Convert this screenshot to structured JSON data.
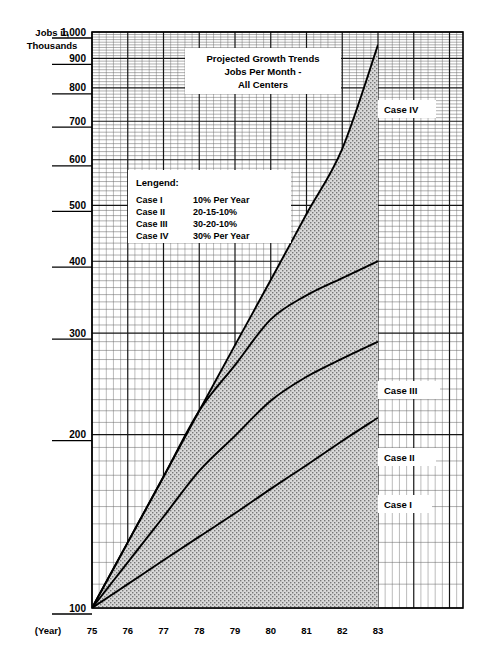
{
  "axis": {
    "y_title_line1": "Jobs in",
    "y_title_line2": "Thousands",
    "x_title": "(Year)",
    "y_ticks": [
      "1,000",
      "900",
      "800",
      "700",
      "600",
      "500",
      "400",
      "300",
      "200",
      "100"
    ],
    "x_ticks": [
      "75",
      "76",
      "77",
      "78",
      "79",
      "80",
      "81",
      "82",
      "83"
    ]
  },
  "title": {
    "line1": "Projected Growth Trends",
    "line2": "Jobs Per Month -",
    "line3": "All Centers"
  },
  "legend": {
    "heading": "Lengend:",
    "rows": [
      {
        "name": "Case I",
        "rate": "10% Per Year"
      },
      {
        "name": "Case II",
        "rate": "20-15-10%"
      },
      {
        "name": "Case III",
        "rate": "30-20-10%"
      },
      {
        "name": "Case IV",
        "rate": "30% Per Year"
      }
    ]
  },
  "curve_labels": {
    "case1": "Case I",
    "case2": "Case II",
    "case3": "Case III",
    "case4": "Case IV"
  },
  "chart_data": {
    "type": "line",
    "title": "Projected Growth Trends Jobs Per Month - All Centers",
    "xlabel": "(Year)",
    "ylabel": "Jobs in Thousands",
    "yscale": "log",
    "ylim": [
      100,
      1000
    ],
    "xlim": [
      75,
      83
    ],
    "grid": true,
    "legend_position": "upper-left-inset",
    "x": [
      75,
      76,
      77,
      78,
      79,
      80,
      81,
      82,
      83
    ],
    "series": [
      {
        "name": "Case I",
        "rate": "10% Per Year",
        "fill": "dark-dense-dots",
        "values": [
          100,
          110,
          121,
          133,
          146,
          161,
          177,
          195,
          214
        ]
      },
      {
        "name": "Case II",
        "rate": "20-15-10%",
        "fill": "white-checker",
        "values": [
          100,
          120,
          144,
          173,
          199,
          229,
          252,
          271,
          290
        ]
      },
      {
        "name": "Case III",
        "rate": "30-20-10%",
        "fill": "medium-crosshatch",
        "values": [
          100,
          130,
          169,
          220,
          264,
          317,
          349,
          374,
          400
        ]
      },
      {
        "name": "Case IV",
        "rate": "30% Per Year",
        "fill": "light-gray-stipple",
        "values": [
          100,
          130,
          169,
          220,
          286,
          371,
          483,
          627,
          950
        ]
      }
    ]
  },
  "colors": {
    "ink": "#000000",
    "grid_major": "#1a1a1a",
    "grid_minor": "#555555",
    "band_case1": "#2b2b2b",
    "band_case2": "#f2f2f2",
    "band_case3": "#6e6e6e",
    "band_case4": "#c9c9c9"
  }
}
